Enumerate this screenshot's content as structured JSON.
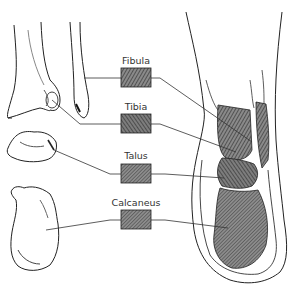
{
  "diagram": {
    "type": "anatomical-ankle-bones",
    "labels": [
      {
        "id": "fibula",
        "text": "Fibula"
      },
      {
        "id": "tibia",
        "text": "Tibia"
      },
      {
        "id": "talus",
        "text": "Talus"
      },
      {
        "id": "calcaneus",
        "text": "Calcaneus"
      }
    ],
    "colors": {
      "ink": "#222222",
      "hatch_fill": "#6a6a6a",
      "box_fill": "#7a7a7a",
      "background": "#ffffff"
    }
  }
}
